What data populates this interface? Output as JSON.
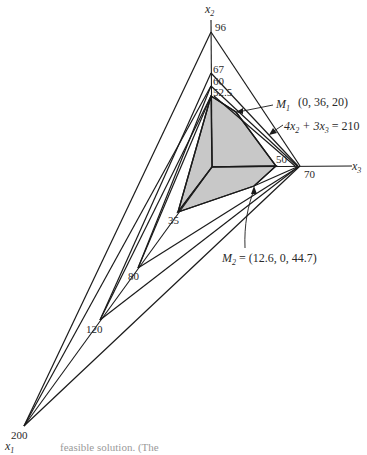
{
  "figure": {
    "axes": {
      "x1": {
        "label": "x",
        "sub": "1"
      },
      "x2": {
        "label": "x",
        "sub": "2"
      },
      "x3": {
        "label": "x",
        "sub": "3"
      }
    },
    "ticks": {
      "x2": [
        "96",
        "67",
        "60",
        "52.5"
      ],
      "x3": [
        "50",
        "70"
      ],
      "x1": [
        "35",
        "80",
        "120",
        "200"
      ]
    },
    "annotations": {
      "m1": {
        "name": "M",
        "sub": "1",
        "coords": "(0, 36, 20)"
      },
      "constraint": {
        "a": "4x",
        "a_sub": "2",
        "b": " + 3x",
        "b_sub": "3",
        "rhs": " = 210"
      },
      "m2": {
        "name": "M",
        "sub": "2",
        "coords": " = (12.6, 0, 44.7)"
      }
    },
    "caption": "feasible solution. (The"
  },
  "colors": {
    "line": "#1a1a1a",
    "shade": "#c8c8c8",
    "background": "#ffffff"
  }
}
